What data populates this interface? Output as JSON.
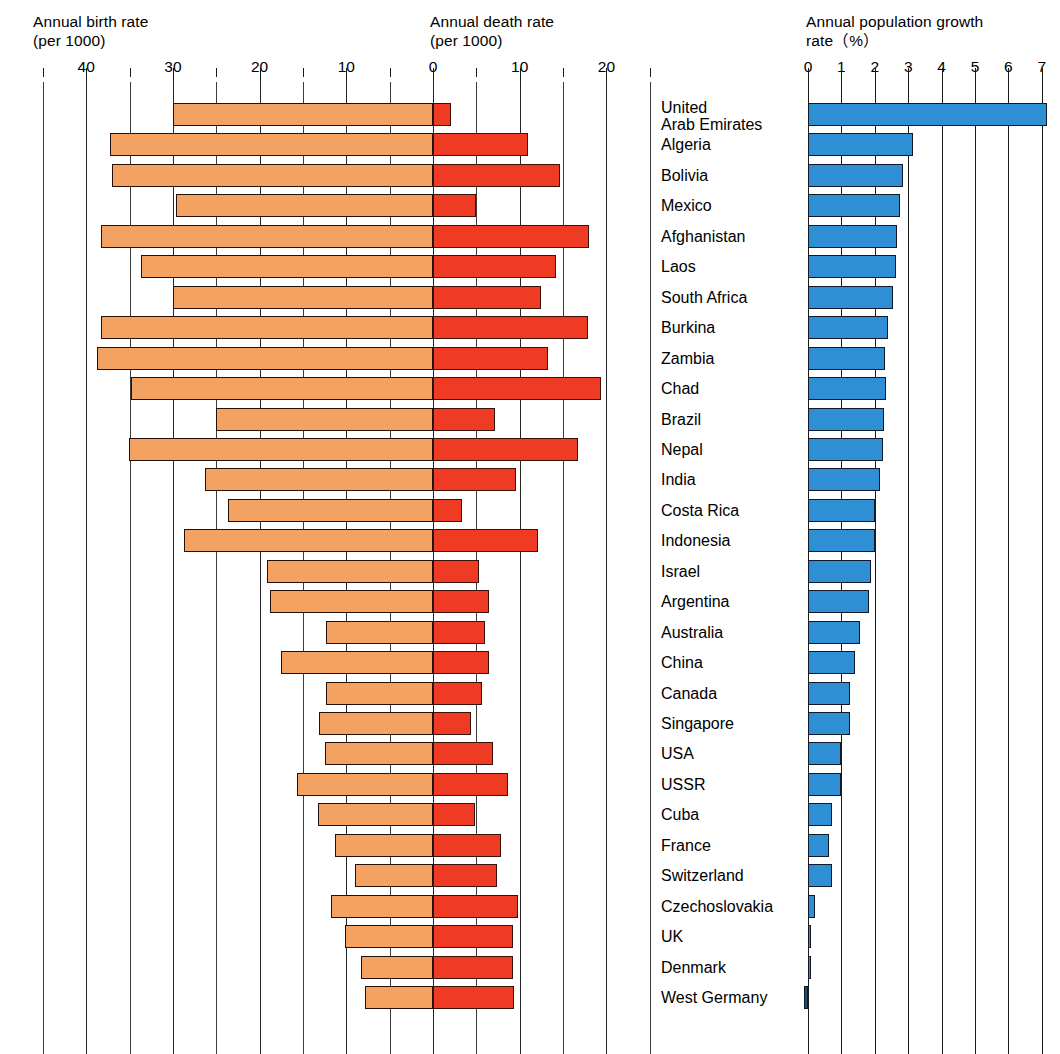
{
  "headers": {
    "birth": "Annual birth rate\n(per 1000)",
    "death": "Annual death rate\n(per 1000)",
    "growth": "Annual population growth\nrate（%）"
  },
  "axes": {
    "birth_ticks": [
      "40",
      "30",
      "20",
      "10"
    ],
    "death_ticks": [
      "0",
      "10",
      "20"
    ],
    "growth_ticks": [
      "0",
      "1",
      "2",
      "3",
      "4",
      "5",
      "6",
      "7"
    ]
  },
  "colors": {
    "birth": "#f4a261",
    "death": "#ef3b23",
    "growth": "#2f8fd4",
    "growth_negative": "#1b4f76",
    "outline": "#231008",
    "grid": "#1a1a1a"
  },
  "chart_data": {
    "type": "bar",
    "orientation": "horizontal",
    "layout": "back-to-back bidirectional bars (birth left, death right) plus separate growth panel",
    "grid": true,
    "legend": "none",
    "panels": [
      {
        "name": "birth",
        "label": "Annual birth rate (per 1000)",
        "xlabel": "per 1000",
        "xlim": [
          45,
          0
        ],
        "direction": "right-to-left",
        "tick_step": 5,
        "labeled_ticks": [
          40,
          30,
          20,
          10,
          0
        ]
      },
      {
        "name": "death",
        "label": "Annual death rate (per 1000)",
        "xlabel": "per 1000",
        "xlim": [
          0,
          25
        ],
        "direction": "left-to-right",
        "tick_step": 5,
        "labeled_ticks": [
          0,
          10,
          20
        ]
      },
      {
        "name": "growth",
        "label": "Annual population growth rate (%)",
        "xlabel": "%",
        "xlim": [
          0,
          7.5
        ],
        "direction": "left-to-right",
        "tick_step": 1,
        "labeled_ticks": [
          0,
          1,
          2,
          3,
          4,
          5,
          6,
          7
        ]
      }
    ],
    "categories": [
      "United\nArab Emirates",
      "Algeria",
      "Bolivia",
      "Mexico",
      "Afghanistan",
      "Laos",
      "South Africa",
      "Burkina",
      "Zambia",
      "Chad",
      "Brazil",
      "Nepal",
      "India",
      "Costa Rica",
      "Indonesia",
      "Israel",
      "Argentina",
      "Australia",
      "China",
      "Canada",
      "Singapore",
      "USA",
      "USSR",
      "Cuba",
      "France",
      "Switzerland",
      "Czechoslovakia",
      "UK",
      "Denmark",
      "West Germany"
    ],
    "series": [
      {
        "name": "Annual birth rate (per 1000)",
        "values": [
          30.0,
          37.3,
          37.0,
          29.6,
          38.3,
          33.7,
          30.0,
          38.3,
          38.7,
          34.8,
          25.0,
          35.1,
          26.3,
          23.7,
          28.7,
          19.1,
          18.8,
          12.3,
          17.5,
          12.3,
          13.1,
          12.4,
          15.7,
          13.3,
          11.3,
          9.0,
          11.8,
          10.2,
          8.3,
          7.8
        ]
      },
      {
        "name": "Annual death rate (per 1000)",
        "values": [
          2.1,
          11.0,
          14.6,
          5.0,
          18.0,
          14.2,
          12.5,
          17.9,
          13.3,
          19.4,
          7.2,
          16.7,
          9.6,
          3.3,
          12.1,
          5.3,
          6.5,
          6.0,
          6.5,
          5.7,
          4.4,
          6.9,
          8.7,
          4.8,
          7.8,
          7.4,
          9.8,
          9.2,
          9.2,
          9.3
        ]
      },
      {
        "name": "Annual population growth rate (%)",
        "values": [
          7.15,
          3.15,
          2.85,
          2.75,
          2.65,
          2.62,
          2.55,
          2.4,
          2.3,
          2.33,
          2.28,
          2.25,
          2.15,
          2.0,
          2.0,
          1.88,
          1.82,
          1.57,
          1.4,
          1.25,
          1.25,
          1.0,
          1.0,
          0.72,
          0.64,
          0.72,
          0.22,
          0.02,
          0.02,
          -0.12
        ]
      }
    ]
  }
}
